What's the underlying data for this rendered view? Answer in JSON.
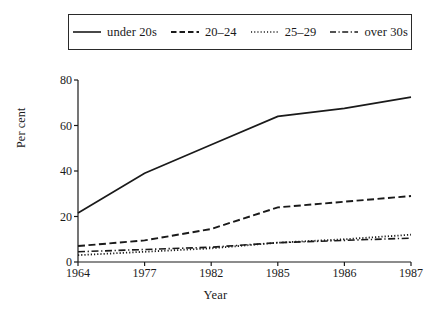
{
  "chart_data": {
    "type": "line",
    "title": "",
    "xlabel": "Year",
    "ylabel": "Per cent",
    "categories": [
      "1964",
      "1977",
      "1982",
      "1985",
      "1986",
      "1987"
    ],
    "ylim": [
      0,
      80
    ],
    "yticks": [
      0,
      20,
      40,
      60,
      80
    ],
    "grid": false,
    "legend_position": "top",
    "series": [
      {
        "name": "under 20s",
        "style": "solid",
        "values": [
          21.5,
          39.0,
          51.5,
          64.0,
          67.5,
          72.5
        ]
      },
      {
        "name": "20–24",
        "style": "dashed",
        "values": [
          7.0,
          9.5,
          14.5,
          24.0,
          26.5,
          29.0
        ]
      },
      {
        "name": "25–29",
        "style": "dotted",
        "values": [
          3.0,
          4.5,
          6.0,
          8.5,
          10.0,
          12.0
        ]
      },
      {
        "name": "over 30s",
        "style": "dash-dot",
        "values": [
          4.5,
          5.5,
          6.5,
          8.5,
          9.5,
          10.5
        ]
      }
    ]
  },
  "legend": {
    "entries": [
      {
        "label": "under 20s",
        "swatch": "solid-line-swatch"
      },
      {
        "label": "20–24",
        "swatch": "dashed-line-swatch"
      },
      {
        "label": "25–29",
        "swatch": "dotted-line-swatch"
      },
      {
        "label": "over 30s",
        "swatch": "dash-dot-line-swatch"
      }
    ]
  },
  "axes": {
    "y_title": "Per cent",
    "x_title": "Year",
    "y_tick_labels": [
      "0",
      "20",
      "40",
      "60",
      "80"
    ],
    "x_tick_labels": [
      "1964",
      "1977",
      "1982",
      "1985",
      "1986",
      "1987"
    ]
  },
  "colors": {
    "ink": "#1a1a1a",
    "background": "#ffffff"
  }
}
